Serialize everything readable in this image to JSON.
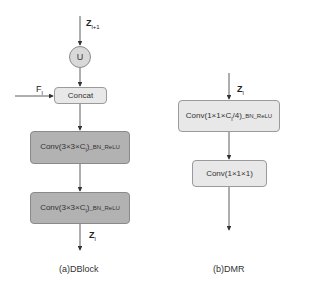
{
  "colors": {
    "light_box": "#e8e8e8",
    "dark_box": "#b2b2b2",
    "circle": "#d9d9d9",
    "line": "#333333"
  },
  "dblock": {
    "caption": "(a)DBlock",
    "input_top": {
      "main": "Z",
      "sub": "l+1"
    },
    "upsample": "U",
    "side_input": {
      "main": "F",
      "sub": "l"
    },
    "concat": "Concat",
    "conv1": {
      "main": "Conv(3×3×C",
      "sub": "l",
      "tail": ")",
      "suffix": "_BN_ReLU"
    },
    "conv2": {
      "main": "Conv(3×3×C",
      "sub": "l",
      "tail": ")",
      "suffix": "_BN_ReLU"
    },
    "output": {
      "main": "Z",
      "sub": "l"
    }
  },
  "dmr": {
    "caption": "(b)DMR",
    "input": {
      "main": "Z",
      "sub": "l"
    },
    "conv1": {
      "main": "Conv(1×1×C",
      "sub": "l",
      "tail": "/4)",
      "suffix": "_BN_ReLU"
    },
    "conv2": "Conv(1×1×1)"
  }
}
